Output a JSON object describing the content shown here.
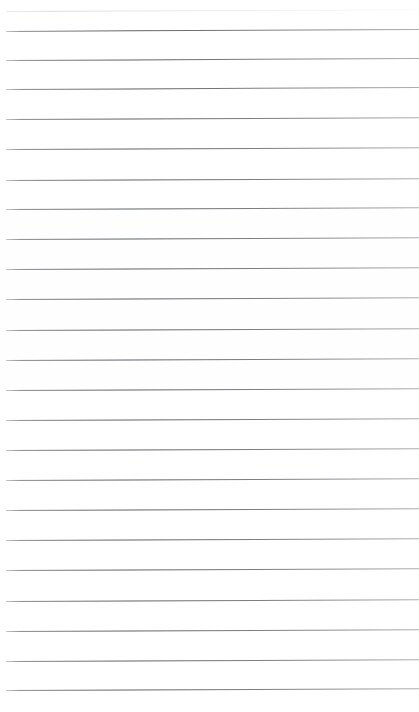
{
  "document": {
    "kind": "scanned-lined-paper",
    "title": "Lined Paper Scan",
    "page_width": 419,
    "page_height": 712,
    "background_color": "#ffffff",
    "rule_color": "#5f6166",
    "faint_rule_color": "#dcdee2",
    "content_text": "",
    "handwriting_text": "",
    "ruling": {
      "count": 24,
      "spacing_px": 29.6,
      "left_margin_px": 6,
      "right_edge_px": 419,
      "slope_deg": -0.25,
      "notes": "blank ruled sheet, no writing present"
    },
    "rules": [
      {
        "index": 1,
        "y": 11,
        "faint": true,
        "slope_deg": -0.22
      },
      {
        "index": 2,
        "y": 31,
        "faint": false,
        "slope_deg": -0.28
      },
      {
        "index": 3,
        "y": 60,
        "faint": false,
        "slope_deg": -0.26
      },
      {
        "index": 4,
        "y": 89,
        "faint": false,
        "slope_deg": -0.26
      },
      {
        "index": 5,
        "y": 119,
        "faint": false,
        "slope_deg": -0.25
      },
      {
        "index": 6,
        "y": 149,
        "faint": false,
        "slope_deg": -0.25
      },
      {
        "index": 7,
        "y": 180,
        "faint": false,
        "slope_deg": -0.25
      },
      {
        "index": 8,
        "y": 209,
        "faint": false,
        "slope_deg": -0.25
      },
      {
        "index": 9,
        "y": 239,
        "faint": false,
        "slope_deg": -0.24
      },
      {
        "index": 10,
        "y": 269,
        "faint": false,
        "slope_deg": -0.24
      },
      {
        "index": 11,
        "y": 299,
        "faint": false,
        "slope_deg": -0.24
      },
      {
        "index": 12,
        "y": 330,
        "faint": false,
        "slope_deg": -0.24
      },
      {
        "index": 13,
        "y": 360,
        "faint": false,
        "slope_deg": -0.24
      },
      {
        "index": 14,
        "y": 390,
        "faint": false,
        "slope_deg": -0.24
      },
      {
        "index": 15,
        "y": 420,
        "faint": false,
        "slope_deg": -0.24
      },
      {
        "index": 16,
        "y": 450,
        "faint": false,
        "slope_deg": -0.24
      },
      {
        "index": 17,
        "y": 480,
        "faint": false,
        "slope_deg": -0.24
      },
      {
        "index": 18,
        "y": 510,
        "faint": false,
        "slope_deg": -0.24
      },
      {
        "index": 19,
        "y": 540,
        "faint": false,
        "slope_deg": -0.24
      },
      {
        "index": 20,
        "y": 570,
        "faint": false,
        "slope_deg": -0.24
      },
      {
        "index": 21,
        "y": 601,
        "faint": false,
        "slope_deg": -0.24
      },
      {
        "index": 22,
        "y": 631,
        "faint": false,
        "slope_deg": -0.24
      },
      {
        "index": 23,
        "y": 661,
        "faint": false,
        "slope_deg": -0.24
      },
      {
        "index": 24,
        "y": 690,
        "faint": false,
        "slope_deg": -0.24
      }
    ]
  }
}
